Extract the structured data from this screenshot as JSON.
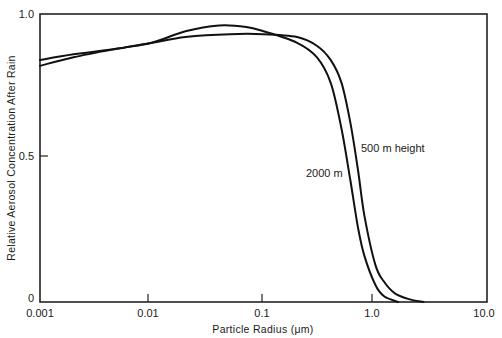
{
  "chart_data": {
    "type": "line",
    "title": "",
    "xlabel": "Particle Radius (μm)",
    "ylabel": "Relative Aerosol Concentration After Rain",
    "xscale": "log",
    "xlim": [
      0.001,
      10.0
    ],
    "ylim": [
      0,
      1.0
    ],
    "x_ticks": [
      "0.001",
      "0.01",
      "0.1",
      "1.0",
      "10.0"
    ],
    "y_ticks": [
      "0",
      "0.5",
      "1.0"
    ],
    "grid": false,
    "legend": "none (direct curve annotations)",
    "annotations": [
      "500 m height",
      "2000 m"
    ],
    "series": [
      {
        "name": "500 m height",
        "x": [
          0.001,
          0.002,
          0.005,
          0.01,
          0.02,
          0.05,
          0.1,
          0.2,
          0.3,
          0.4,
          0.5,
          0.6,
          0.7,
          0.8,
          1.0,
          1.2,
          1.5,
          2.0,
          2.7
        ],
        "y": [
          0.84,
          0.86,
          0.88,
          0.9,
          0.92,
          0.93,
          0.93,
          0.92,
          0.89,
          0.84,
          0.76,
          0.62,
          0.46,
          0.3,
          0.13,
          0.07,
          0.03,
          0.01,
          0.0
        ]
      },
      {
        "name": "2000 m",
        "x": [
          0.001,
          0.002,
          0.005,
          0.01,
          0.02,
          0.04,
          0.07,
          0.1,
          0.2,
          0.3,
          0.4,
          0.5,
          0.6,
          0.7,
          0.8,
          1.0,
          1.2,
          1.6
        ],
        "y": [
          0.82,
          0.85,
          0.88,
          0.9,
          0.94,
          0.96,
          0.955,
          0.94,
          0.9,
          0.85,
          0.76,
          0.6,
          0.42,
          0.26,
          0.16,
          0.06,
          0.02,
          0.0
        ]
      }
    ]
  },
  "axes": {
    "x_label": "Particle Radius (μm)",
    "y_label": "Relative Aerosol Concentration After Rain",
    "x_ticks": [
      {
        "label": "0.001",
        "x": 40
      },
      {
        "label": "0.01",
        "x": 148
      },
      {
        "label": "0.1",
        "x": 262
      },
      {
        "label": "1.0",
        "x": 372
      },
      {
        "label": "10.0",
        "x": 487
      }
    ],
    "y_ticks": [
      {
        "label": "1.0",
        "y": 14
      },
      {
        "label": "0.5",
        "y": 156
      },
      {
        "label": "0",
        "y": 302
      }
    ]
  },
  "annotations": {
    "upper": "500 m height",
    "lower": "2000 m"
  }
}
